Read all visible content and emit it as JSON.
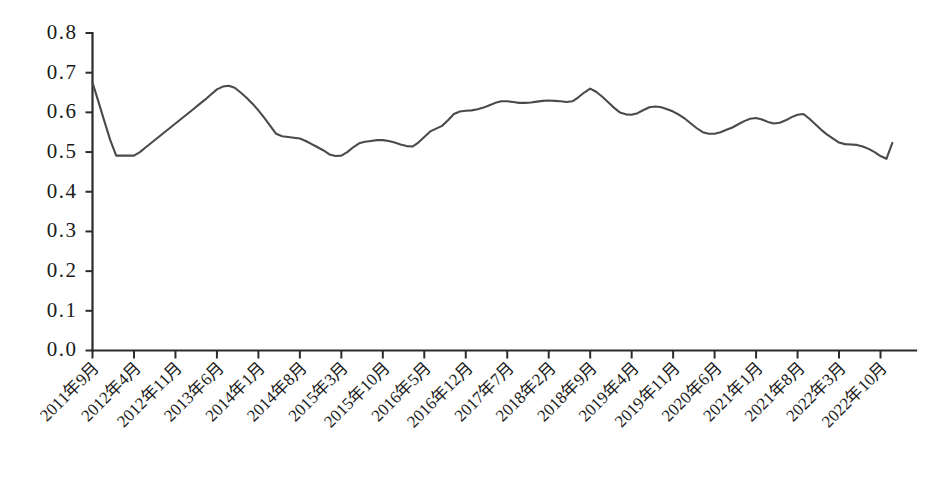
{
  "chart_data": {
    "type": "line",
    "title": "",
    "subtitle": "",
    "xlabel": "",
    "ylabel": "",
    "ylim": [
      0.0,
      0.8
    ],
    "y_ticks": [
      "0.0",
      "0.1",
      "0.2",
      "0.3",
      "0.4",
      "0.5",
      "0.6",
      "0.7",
      "0.8"
    ],
    "y_tick_values": [
      0.0,
      0.1,
      0.2,
      0.3,
      0.4,
      0.5,
      0.6,
      0.7,
      0.8
    ],
    "grid": false,
    "legend": null,
    "legend_position": "none",
    "line_color": "#4a4a4a",
    "axis_color": "#2b2b2b",
    "background_color": "#ffffff",
    "x_tick_labels": [
      "2011年9月",
      "2012年4月",
      "2012年11月",
      "2013年6月",
      "2014年1月",
      "2014年8月",
      "2015年3月",
      "2015年10月",
      "2016年5月",
      "2016年12月",
      "2017年7月",
      "2018年2月",
      "2018年9月",
      "2019年4月",
      "2019年11月",
      "2020年6月",
      "2021年1月",
      "2021年8月",
      "2022年3月",
      "2022年10月"
    ],
    "x_tick_interval_months": 7,
    "x_start": "2011年9月",
    "x_end": "2022年12月",
    "x": [
      "2011年9月",
      "2011年10月",
      "2011年11月",
      "2011年12月",
      "2012年1月",
      "2012年2月",
      "2012年3月",
      "2012年4月",
      "2012年5月",
      "2012年6月",
      "2012年7月",
      "2012年8月",
      "2012年9月",
      "2012年10月",
      "2012年11月",
      "2012年12月",
      "2013年1月",
      "2013年2月",
      "2013年3月",
      "2013年4月",
      "2013年5月",
      "2013年6月",
      "2013年7月",
      "2013年8月",
      "2013年9月",
      "2013年10月",
      "2013年11月",
      "2013年12月",
      "2014年1月",
      "2014年2月",
      "2014年3月",
      "2014年4月",
      "2014年5月",
      "2014年6月",
      "2014年7月",
      "2014年8月",
      "2014年9月",
      "2014年10月",
      "2014年11月",
      "2014年12月",
      "2015年1月",
      "2015年2月",
      "2015年3月",
      "2015年4月",
      "2015年5月",
      "2015年6月",
      "2015年7月",
      "2015年8月",
      "2015年9月",
      "2015年10月",
      "2015年11月",
      "2015年12月",
      "2016年1月",
      "2016年2月",
      "2016年3月",
      "2016年4月",
      "2016年5月",
      "2016年6月",
      "2016年7月",
      "2016年8月",
      "2016年9月",
      "2016年10月",
      "2016年11月",
      "2016年12月",
      "2017年1月",
      "2017年2月",
      "2017年3月",
      "2017年4月",
      "2017年5月",
      "2017年6月",
      "2017年7月",
      "2017年8月",
      "2017年9月",
      "2017年10月",
      "2017年11月",
      "2017年12月",
      "2018年1月",
      "2018年2月",
      "2018年3月",
      "2018年4月",
      "2018年5月",
      "2018年6月",
      "2018年7月",
      "2018年8月",
      "2018年9月",
      "2018年10月",
      "2018年11月",
      "2018年12月",
      "2019年1月",
      "2019年2月",
      "2019年3月",
      "2019年4月",
      "2019年5月",
      "2019年6月",
      "2019年7月",
      "2019年8月",
      "2019年9月",
      "2019年10月",
      "2019年11月",
      "2019年12月",
      "2020年1月",
      "2020年2月",
      "2020年3月",
      "2020年4月",
      "2020年5月",
      "2020年6月",
      "2020年7月",
      "2020年8月",
      "2020年9月",
      "2020年10月",
      "2020年11月",
      "2020年12月",
      "2021年1月",
      "2021年2月",
      "2021年3月",
      "2021年4月",
      "2021年5月",
      "2021年6月",
      "2021年7月",
      "2021年8月",
      "2021年9月",
      "2021年10月",
      "2021年11月",
      "2021年12月",
      "2022年1月",
      "2022年2月",
      "2022年3月",
      "2022年4月",
      "2022年5月",
      "2022年6月",
      "2022年7月",
      "2022年8月",
      "2022年9月",
      "2022年10月",
      "2022年11月",
      "2022年12月"
    ],
    "values": [
      0.675,
      0.627,
      0.578,
      0.53,
      0.491,
      0.491,
      0.491,
      0.491,
      0.5,
      0.512,
      0.524,
      0.536,
      0.548,
      0.56,
      0.572,
      0.584,
      0.596,
      0.608,
      0.62,
      0.632,
      0.645,
      0.658,
      0.665,
      0.667,
      0.662,
      0.65,
      0.637,
      0.622,
      0.605,
      0.586,
      0.566,
      0.546,
      0.54,
      0.538,
      0.536,
      0.534,
      0.528,
      0.52,
      0.512,
      0.504,
      0.494,
      0.49,
      0.491,
      0.5,
      0.512,
      0.522,
      0.526,
      0.528,
      0.53,
      0.53,
      0.528,
      0.524,
      0.519,
      0.515,
      0.514,
      0.524,
      0.538,
      0.552,
      0.559,
      0.566,
      0.58,
      0.596,
      0.602,
      0.604,
      0.605,
      0.608,
      0.612,
      0.618,
      0.624,
      0.628,
      0.628,
      0.626,
      0.624,
      0.624,
      0.625,
      0.627,
      0.629,
      0.63,
      0.629,
      0.628,
      0.626,
      0.628,
      0.638,
      0.65,
      0.66,
      0.652,
      0.64,
      0.626,
      0.612,
      0.6,
      0.595,
      0.594,
      0.598,
      0.606,
      0.613,
      0.615,
      0.613,
      0.608,
      0.602,
      0.594,
      0.584,
      0.572,
      0.56,
      0.55,
      0.546,
      0.546,
      0.55,
      0.556,
      0.562,
      0.57,
      0.578,
      0.584,
      0.586,
      0.582,
      0.576,
      0.572,
      0.574,
      0.58,
      0.588,
      0.594,
      0.596,
      0.584,
      0.57,
      0.556,
      0.544,
      0.534,
      0.524,
      0.52,
      0.519,
      0.518,
      0.514,
      0.508,
      0.5,
      0.49,
      0.483,
      0.523
    ],
    "min_value": 0.483,
    "max_value": 0.675,
    "first_value": 0.675,
    "last_value": 0.523
  }
}
